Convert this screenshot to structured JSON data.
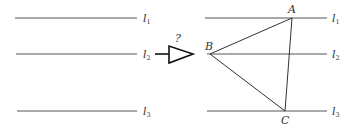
{
  "diagram": {
    "left_panel": {
      "lines": [
        {
          "label": "l",
          "sub": "1",
          "y": 18,
          "x1": 15,
          "x2": 137
        },
        {
          "label": "l",
          "sub": "2",
          "y": 54,
          "x1": 16,
          "x2": 137
        },
        {
          "label": "l",
          "sub": "3",
          "y": 111,
          "x1": 17,
          "x2": 137
        }
      ]
    },
    "arrow": {
      "question_mark": "?"
    },
    "right_panel": {
      "lines": [
        {
          "label": "l",
          "sub": "1",
          "y": 18,
          "x1": 205,
          "x2": 327
        },
        {
          "label": "l",
          "sub": "2",
          "y": 54,
          "x1": 207,
          "x2": 327
        },
        {
          "label": "l",
          "sub": "3",
          "y": 111,
          "x1": 207,
          "x2": 327
        }
      ],
      "points": {
        "A": {
          "label": "A",
          "x": 292,
          "y": 18
        },
        "B": {
          "label": "B",
          "x": 210,
          "y": 54
        },
        "C": {
          "label": "C",
          "x": 285,
          "y": 111
        }
      }
    }
  }
}
